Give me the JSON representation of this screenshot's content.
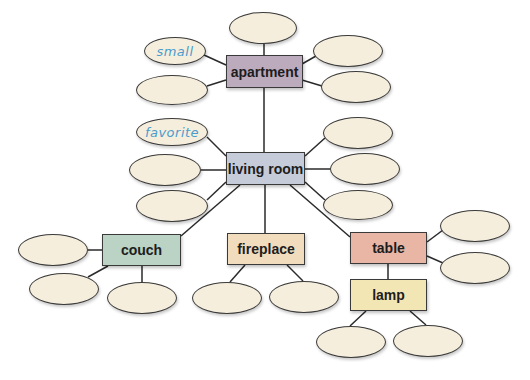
{
  "diagram": {
    "type": "word-web",
    "nodes": [
      {
        "id": "apartment",
        "label": "apartment",
        "x": 226,
        "y": 55,
        "w": 77,
        "h": 33,
        "color": "#bcaabd"
      },
      {
        "id": "living_room",
        "label": "living room",
        "x": 226,
        "y": 152,
        "w": 79,
        "h": 33,
        "color": "#c5cbd9"
      },
      {
        "id": "couch",
        "label": "couch",
        "x": 102,
        "y": 234,
        "w": 79,
        "h": 32,
        "color": "#bad3c5"
      },
      {
        "id": "fireplace",
        "label": "fireplace",
        "x": 227,
        "y": 233,
        "w": 78,
        "h": 32,
        "color": "#f1dcbd"
      },
      {
        "id": "table",
        "label": "table",
        "x": 350,
        "y": 232,
        "w": 77,
        "h": 32,
        "color": "#e9b5a5"
      },
      {
        "id": "lamp",
        "label": "lamp",
        "x": 350,
        "y": 279,
        "w": 77,
        "h": 32,
        "color": "#f3e6b5"
      }
    ],
    "bubbles": [
      {
        "parent": "apartment",
        "cx": 263,
        "cy": 28,
        "rx": 34,
        "ry": 16,
        "text": ""
      },
      {
        "parent": "apartment",
        "cx": 175,
        "cy": 51,
        "rx": 31,
        "ry": 14,
        "text": "small"
      },
      {
        "parent": "apartment",
        "cx": 172,
        "cy": 90,
        "rx": 36,
        "ry": 15,
        "text": ""
      },
      {
        "parent": "apartment",
        "cx": 348,
        "cy": 51,
        "rx": 35,
        "ry": 16,
        "text": ""
      },
      {
        "parent": "apartment",
        "cx": 356,
        "cy": 87,
        "rx": 35,
        "ry": 16,
        "text": ""
      },
      {
        "parent": "living_room",
        "cx": 172,
        "cy": 132,
        "rx": 36,
        "ry": 14,
        "text": "favorite"
      },
      {
        "parent": "living_room",
        "cx": 165,
        "cy": 170,
        "rx": 36,
        "ry": 16,
        "text": ""
      },
      {
        "parent": "living_room",
        "cx": 172,
        "cy": 206,
        "rx": 36,
        "ry": 16,
        "text": ""
      },
      {
        "parent": "living_room",
        "cx": 358,
        "cy": 133,
        "rx": 35,
        "ry": 16,
        "text": ""
      },
      {
        "parent": "living_room",
        "cx": 365,
        "cy": 169,
        "rx": 35,
        "ry": 16,
        "text": ""
      },
      {
        "parent": "living_room",
        "cx": 358,
        "cy": 205,
        "rx": 35,
        "ry": 15,
        "text": ""
      },
      {
        "parent": "couch",
        "cx": 53,
        "cy": 250,
        "rx": 35,
        "ry": 16,
        "text": ""
      },
      {
        "parent": "couch",
        "cx": 64,
        "cy": 289,
        "rx": 35,
        "ry": 16,
        "text": ""
      },
      {
        "parent": "couch",
        "cx": 142,
        "cy": 298,
        "rx": 35,
        "ry": 16,
        "text": ""
      },
      {
        "parent": "fireplace",
        "cx": 227,
        "cy": 298,
        "rx": 35,
        "ry": 16,
        "text": ""
      },
      {
        "parent": "fireplace",
        "cx": 304,
        "cy": 297,
        "rx": 35,
        "ry": 16,
        "text": ""
      },
      {
        "parent": "table",
        "cx": 475,
        "cy": 226,
        "rx": 35,
        "ry": 16,
        "text": ""
      },
      {
        "parent": "table",
        "cx": 475,
        "cy": 268,
        "rx": 35,
        "ry": 16,
        "text": ""
      },
      {
        "parent": "lamp",
        "cx": 351,
        "cy": 342,
        "rx": 35,
        "ry": 16,
        "text": ""
      },
      {
        "parent": "lamp",
        "cx": 428,
        "cy": 341,
        "rx": 35,
        "ry": 16,
        "text": ""
      }
    ],
    "edges": [
      {
        "from": "apartment",
        "to": "living_room",
        "x1": 264,
        "y1": 88,
        "x2": 264,
        "y2": 152
      },
      {
        "from": "living_room",
        "to": "couch",
        "x1": 240,
        "y1": 185,
        "x2": 181,
        "y2": 236
      },
      {
        "from": "living_room",
        "to": "fireplace",
        "x1": 265,
        "y1": 185,
        "x2": 265,
        "y2": 233
      },
      {
        "from": "living_room",
        "to": "table",
        "x1": 290,
        "y1": 185,
        "x2": 350,
        "y2": 237
      },
      {
        "from": "table",
        "to": "lamp",
        "x1": 388,
        "y1": 264,
        "x2": 388,
        "y2": 279
      },
      {
        "x1": 264,
        "y1": 44,
        "x2": 264,
        "y2": 55
      },
      {
        "x1": 204,
        "y1": 55,
        "x2": 226,
        "y2": 65
      },
      {
        "x1": 207,
        "y1": 86,
        "x2": 226,
        "y2": 80
      },
      {
        "x1": 302,
        "y1": 64,
        "x2": 316,
        "y2": 56
      },
      {
        "x1": 302,
        "y1": 80,
        "x2": 322,
        "y2": 86
      },
      {
        "x1": 207,
        "y1": 137,
        "x2": 226,
        "y2": 156
      },
      {
        "x1": 201,
        "y1": 170,
        "x2": 226,
        "y2": 170
      },
      {
        "x1": 207,
        "y1": 200,
        "x2": 226,
        "y2": 182
      },
      {
        "x1": 305,
        "y1": 156,
        "x2": 325,
        "y2": 138
      },
      {
        "x1": 305,
        "y1": 169,
        "x2": 330,
        "y2": 169
      },
      {
        "x1": 305,
        "y1": 182,
        "x2": 325,
        "y2": 200
      },
      {
        "x1": 88,
        "y1": 250,
        "x2": 102,
        "y2": 250
      },
      {
        "x1": 88,
        "y1": 277,
        "x2": 108,
        "y2": 266
      },
      {
        "x1": 142,
        "y1": 266,
        "x2": 142,
        "y2": 282
      },
      {
        "x1": 245,
        "y1": 265,
        "x2": 230,
        "y2": 282
      },
      {
        "x1": 287,
        "y1": 265,
        "x2": 303,
        "y2": 281
      },
      {
        "x1": 427,
        "y1": 242,
        "x2": 443,
        "y2": 230
      },
      {
        "x1": 427,
        "y1": 256,
        "x2": 443,
        "y2": 263
      },
      {
        "x1": 366,
        "y1": 311,
        "x2": 350,
        "y2": 326
      },
      {
        "x1": 410,
        "y1": 311,
        "x2": 426,
        "y2": 325
      }
    ]
  },
  "labels": {
    "apartment": "apartment",
    "living_room": "living room",
    "couch": "couch",
    "fireplace": "fireplace",
    "table": "table",
    "lamp": "lamp",
    "bubble_small": "small",
    "bubble_favorite": "favorite"
  }
}
